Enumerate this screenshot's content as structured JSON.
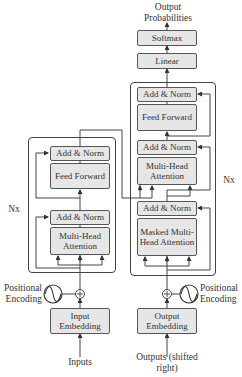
{
  "output": {
    "label": "Output Probabilities"
  },
  "decoder": {
    "softmax": "Softmax",
    "linear": "Linear",
    "add_norm_top": "Add & Norm",
    "feed_forward": "Feed Forward",
    "add_norm_mid": "Add & Norm",
    "multi_head_attention": "Multi-Head Attention",
    "add_norm_bottom": "Add & Norm",
    "masked_attention": "Masked Multi-Head Attention",
    "repeat": "Nx",
    "positional_encoding": "Positional Encoding",
    "embedding": "Output Embedding",
    "input_label": "Outputs (shifted right)"
  },
  "encoder": {
    "add_norm_top": "Add & Norm",
    "feed_forward": "Feed Forward",
    "add_norm_bottom": "Add & Norm",
    "multi_head_attention": "Multi-Head Attention",
    "repeat": "Nx",
    "positional_encoding": "Positional Encoding",
    "embedding": "Input Embedding",
    "input_label": "Inputs"
  },
  "colors": {
    "box_fill": "#e6e6e6",
    "stroke": "#444444",
    "text": "#333333"
  }
}
